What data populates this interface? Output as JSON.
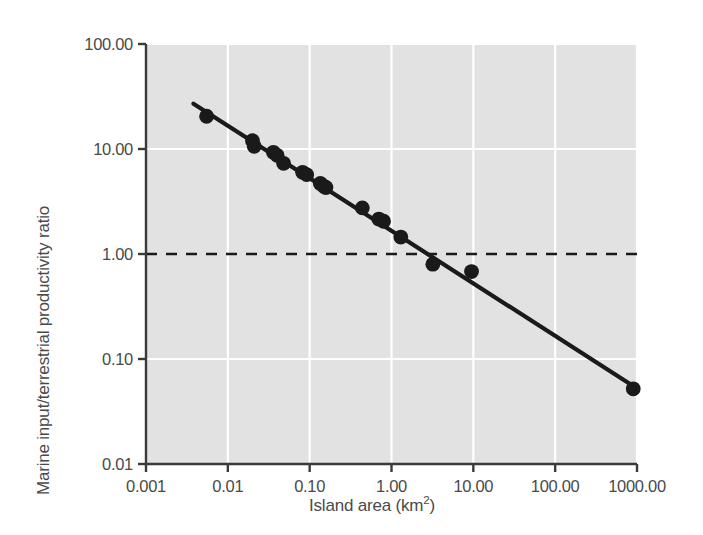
{
  "chart_data": {
    "type": "scatter",
    "title": "",
    "xlabel": "Island area (km2)",
    "xlabel_base": "Island area (km",
    "xlabel_sup": "2",
    "xlabel_tail": ")",
    "ylabel": "Marine input/terrestrial productivity ratio",
    "xscale": "log",
    "yscale": "log",
    "xlim": [
      0.001,
      1000
    ],
    "ylim": [
      0.01,
      100
    ],
    "grid": true,
    "grid_color": "#ffffff",
    "plot_background": "#e2e2e2",
    "marker_color": "#1a1a1a",
    "line_color": "#1a1a1a",
    "xticks": [
      "0.001",
      "0.01",
      "0.10",
      "1.00",
      "10.00",
      "100.00",
      "1000.00"
    ],
    "xtick_values": [
      0.001,
      0.01,
      0.1,
      1,
      10,
      100,
      1000
    ],
    "yticks": [
      "0.01",
      "0.10",
      "1.00",
      "10.00",
      "100.00"
    ],
    "ytick_values": [
      0.01,
      0.1,
      1,
      10,
      100
    ],
    "points": [
      {
        "x": 0.0055,
        "y": 20.5
      },
      {
        "x": 0.02,
        "y": 12.0
      },
      {
        "x": 0.021,
        "y": 10.6
      },
      {
        "x": 0.036,
        "y": 9.3
      },
      {
        "x": 0.04,
        "y": 8.7
      },
      {
        "x": 0.048,
        "y": 7.3
      },
      {
        "x": 0.082,
        "y": 6.0
      },
      {
        "x": 0.092,
        "y": 5.7
      },
      {
        "x": 0.135,
        "y": 4.7
      },
      {
        "x": 0.15,
        "y": 4.4
      },
      {
        "x": 0.158,
        "y": 4.3
      },
      {
        "x": 0.44,
        "y": 2.75
      },
      {
        "x": 0.7,
        "y": 2.15
      },
      {
        "x": 0.8,
        "y": 2.05
      },
      {
        "x": 1.3,
        "y": 1.45
      },
      {
        "x": 3.2,
        "y": 0.8
      },
      {
        "x": 9.5,
        "y": 0.68
      },
      {
        "x": 900,
        "y": 0.052
      }
    ],
    "fit_line": {
      "label": "regression-line",
      "x_start": 0.0038,
      "y_start": 27.0,
      "x_end": 980,
      "y_end": 0.053
    },
    "reference_line": {
      "label": "ratio-equals-one",
      "y": 1.0,
      "style": "dashed"
    }
  }
}
